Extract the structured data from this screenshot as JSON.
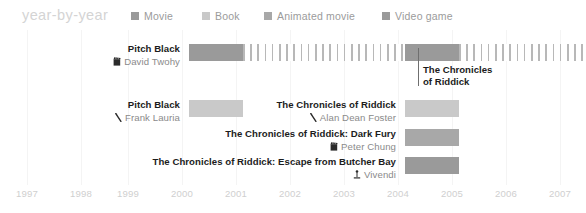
{
  "header": {
    "title": "year-by-year",
    "legend": [
      {
        "label": "Movie",
        "color": "#9a9a9a",
        "x": 131
      },
      {
        "label": "Book",
        "color": "#c9c9c9",
        "x": 202
      },
      {
        "label": "Animated movie",
        "color": "#a8a8a8",
        "x": 264
      },
      {
        "label": "Video game",
        "color": "#9a9a9a",
        "x": 382
      }
    ]
  },
  "axis": {
    "years": [
      "1997",
      "1998",
      "1999",
      "2000",
      "2001",
      "2002",
      "2003",
      "2004",
      "2005",
      "2006",
      "2007"
    ],
    "x_positions": [
      27,
      81,
      128,
      182,
      236,
      290,
      344,
      398,
      452,
      506,
      560
    ],
    "pixels_per_year": 54,
    "grid": true
  },
  "callout": {
    "line1": "The Chronicles",
    "line2": "of Riddick",
    "x": 418,
    "top": 64,
    "line_top": 48,
    "line_height": 38,
    "color": "#6f6f6f"
  },
  "rows": [
    {
      "name": "pitch-black-movie",
      "title": "Pitch Black",
      "author": "David Twohy",
      "icon": "film-clapper-icon",
      "label_right": 180,
      "label_top": 43,
      "bar_top": 44,
      "segments": [
        {
          "kind": "solid",
          "start_year": 2000,
          "end_year": 2001,
          "color": "#9a9a9a"
        },
        {
          "kind": "hatch",
          "start_year": 2001,
          "end_year": 2004,
          "color": "#b8b8b8"
        },
        {
          "kind": "solid",
          "start_year": 2004,
          "end_year": 2005,
          "color": "#9a9a9a"
        },
        {
          "kind": "hatch",
          "start_year": 2005,
          "end_year": 2008,
          "color": "#b8b8b8"
        }
      ]
    },
    {
      "name": "pitch-black-book",
      "title": "Pitch Black",
      "author": "Frank Lauria",
      "icon": "book-pen-icon",
      "label_right": 180,
      "label_top": 99,
      "bar_top": 100,
      "segments": [
        {
          "kind": "solid",
          "start_year": 2000,
          "end_year": 2001,
          "color": "#c9c9c9"
        }
      ]
    },
    {
      "name": "chronicles-of-riddick-book",
      "title": "The Chronicles of Riddick",
      "author": "Alan Dean Foster",
      "icon": "book-pen-icon",
      "label_right": 396,
      "label_top": 99,
      "bar_top": 100,
      "segments": [
        {
          "kind": "solid",
          "start_year": 2004,
          "end_year": 2005,
          "color": "#c9c9c9"
        }
      ]
    },
    {
      "name": "dark-fury-animated",
      "title": "The Chronicles of Riddick: Dark Fury",
      "author": "Peter Chung",
      "icon": "film-clapper-icon",
      "label_right": 396,
      "label_top": 128,
      "bar_top": 129,
      "segments": [
        {
          "kind": "solid",
          "start_year": 2004,
          "end_year": 2005,
          "color": "#a8a8a8"
        }
      ]
    },
    {
      "name": "butcher-bay-game",
      "title": "The Chronicles of Riddick: Escape from Butcher Bay",
      "author": "Vivendi",
      "icon": "joystick-icon",
      "label_right": 396,
      "label_top": 156,
      "bar_top": 157,
      "segments": [
        {
          "kind": "solid",
          "start_year": 2004,
          "end_year": 2005,
          "color": "#9a9a9a"
        }
      ]
    }
  ],
  "chart_data": {
    "type": "bar",
    "title": "year-by-year",
    "xlabel": "",
    "ylabel": "",
    "xlim": [
      1997,
      2007
    ],
    "grid": true,
    "legend_position": "top",
    "categories": [
      "Pitch Black (David Twohy)",
      "Pitch Black (Frank Lauria)",
      "The Chronicles of Riddick (Alan Dean Foster)",
      "The Chronicles of Riddick: Dark Fury (Peter Chung)",
      "The Chronicles of Riddick: Escape from Butcher Bay (Vivendi)"
    ],
    "series": [
      {
        "name": "Movie",
        "color": "#9a9a9a",
        "bars": [
          {
            "category": "Pitch Black (David Twohy)",
            "start": 2000,
            "end": 2001,
            "style": "solid"
          },
          {
            "category": "Pitch Black (David Twohy)",
            "start": 2001,
            "end": 2004,
            "style": "hatched"
          },
          {
            "category": "Pitch Black (David Twohy)",
            "start": 2004,
            "end": 2005,
            "style": "solid"
          },
          {
            "category": "Pitch Black (David Twohy)",
            "start": 2005,
            "end": 2008,
            "style": "hatched"
          }
        ]
      },
      {
        "name": "Book",
        "color": "#c9c9c9",
        "bars": [
          {
            "category": "Pitch Black (Frank Lauria)",
            "start": 2000,
            "end": 2001,
            "style": "solid"
          },
          {
            "category": "The Chronicles of Riddick (Alan Dean Foster)",
            "start": 2004,
            "end": 2005,
            "style": "solid"
          }
        ]
      },
      {
        "name": "Animated movie",
        "color": "#a8a8a8",
        "bars": [
          {
            "category": "The Chronicles of Riddick: Dark Fury (Peter Chung)",
            "start": 2004,
            "end": 2005,
            "style": "solid"
          }
        ]
      },
      {
        "name": "Video game",
        "color": "#9a9a9a",
        "bars": [
          {
            "category": "The Chronicles of Riddick: Escape from Butcher Bay (Vivendi)",
            "start": 2004,
            "end": 2005,
            "style": "solid"
          }
        ]
      }
    ],
    "annotations": [
      {
        "text": "The Chronicles of Riddick",
        "at_year": 2005,
        "note": "leader line marking 2005 release cluster"
      }
    ]
  }
}
